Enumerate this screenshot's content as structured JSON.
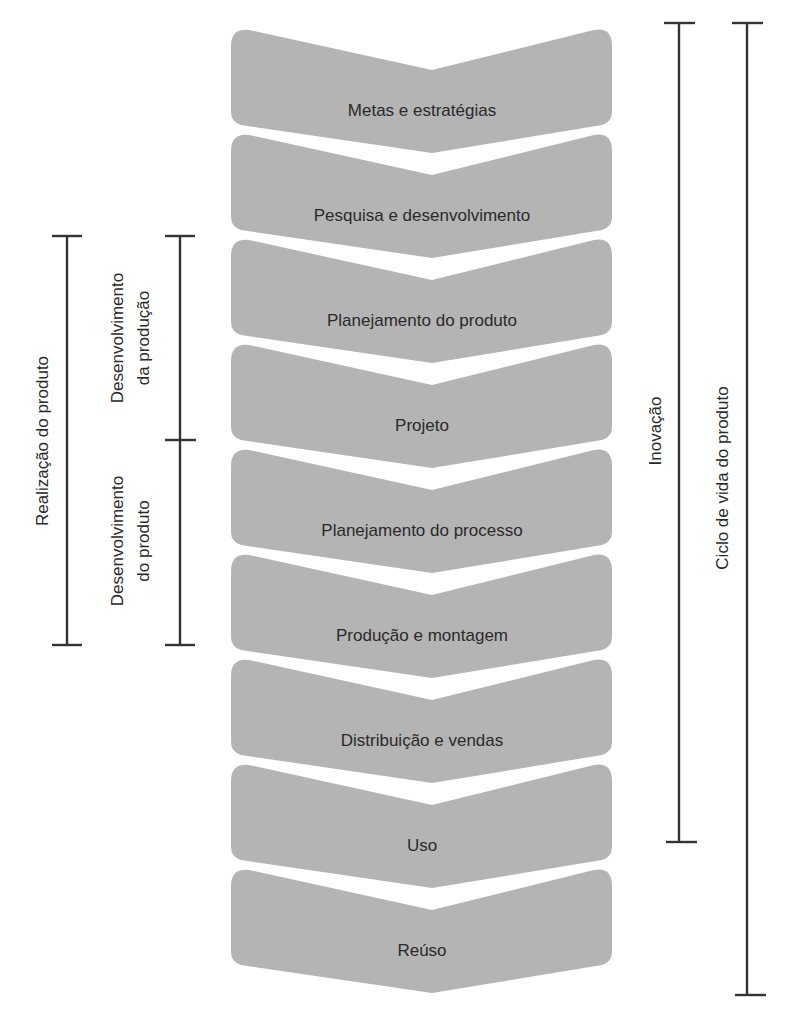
{
  "diagram": {
    "colors": {
      "chevron_fill": "#b4b4b4",
      "text": "#2a2a2a",
      "bracket": "#333333",
      "background": "#ffffff"
    },
    "stages": [
      {
        "label": "Metas e estratégias"
      },
      {
        "label": "Pesquisa e desenvolvimento"
      },
      {
        "label": "Planejamento do produto"
      },
      {
        "label": "Projeto"
      },
      {
        "label": "Planejamento do processo"
      },
      {
        "label": "Produção e montagem"
      },
      {
        "label": "Distribuição e vendas"
      },
      {
        "label": "Uso"
      },
      {
        "label": "Reúso"
      }
    ],
    "brackets": {
      "realizacao": {
        "label": "Realização do produto",
        "spans_stages": "Planejamento do produto – Produção e montagem"
      },
      "desenvolvimento_producao": {
        "label_line1": "Desenvolvimento",
        "label_line2": "da produção",
        "spans_stages": "Planejamento do produto – Projeto"
      },
      "desenvolvimento_produto": {
        "label_line1": "Desenvolvimento",
        "label_line2": "do produto",
        "spans_stages": "Planejamento do processo – Produção e montagem"
      },
      "inovacao": {
        "label": "Inovação",
        "spans_stages": "Metas e estratégias – Uso"
      },
      "ciclo_vida": {
        "label": "Ciclo de vida do produto",
        "spans_stages": "Metas e estratégias – Reúso"
      }
    }
  }
}
